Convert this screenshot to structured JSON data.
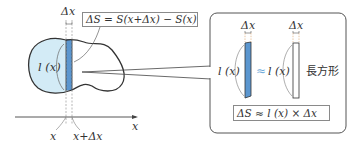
{
  "diagram": {
    "colors": {
      "region_fill": "#d3ebf6",
      "strip_fill": "#5b96cf",
      "outline": "#333333",
      "dashed": "#999999",
      "approx_symbol": "#6aa8d8",
      "box_border": "#555555"
    },
    "left": {
      "delta_x_top": "Δx",
      "delta_s_formula": "ΔS = S(x+Δx) − S(x)",
      "length_label": "l (x)",
      "axis_label": "x",
      "tick_x": "x",
      "tick_x_plus_dx": "x+Δx"
    },
    "callout": {
      "strip_delta_x": "Δx",
      "rect_delta_x": "Δx",
      "strip_length_label": "l (x)",
      "approx": "≈",
      "rect_length_label": "l (x)",
      "rectangle_label": "長方形",
      "approx_formula": "ΔS ≈ l (x) × Δx"
    }
  }
}
